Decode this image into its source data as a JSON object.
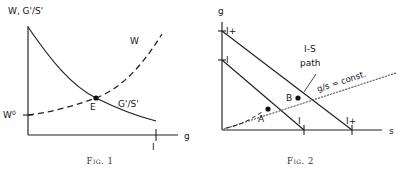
{
  "figures": [
    {
      "id": "fig-1",
      "caption": "Fig. 1",
      "axes": {
        "y_label": "W, G'/S'",
        "x_label": "g",
        "y_origin_label": "W",
        "y_origin_superscript": "0",
        "x_tick_label": "I"
      },
      "curves": [
        {
          "name": "G'/S'",
          "label": "G'/S'",
          "style": "solid",
          "shape": "decreasing-convex"
        },
        {
          "name": "W",
          "label": "W",
          "style": "dashed",
          "shape": "increasing-convex"
        }
      ],
      "points": [
        {
          "name": "E",
          "label": "E",
          "meaning": "equilibrium-intersection"
        }
      ]
    },
    {
      "id": "fig-2",
      "caption": "Fig. 2",
      "axes": {
        "y_label": "g",
        "x_label": "s",
        "y_tick_labels": [
          "I+",
          "I"
        ],
        "x_tick_labels": [
          "I",
          "I+"
        ]
      },
      "annotations": [
        {
          "name": "is-path",
          "line1": "I-S",
          "line2": "path"
        },
        {
          "name": "gs-const",
          "text": "g/s = const."
        }
      ],
      "points": [
        {
          "name": "A",
          "label": "A"
        },
        {
          "name": "B",
          "label": "B"
        }
      ],
      "curves": [
        {
          "name": "constraint-line-I",
          "style": "solid"
        },
        {
          "name": "constraint-line-I-plus",
          "style": "solid"
        },
        {
          "name": "gs-ray",
          "style": "dotted"
        },
        {
          "name": "origin-arc",
          "style": "dashed"
        }
      ]
    }
  ]
}
